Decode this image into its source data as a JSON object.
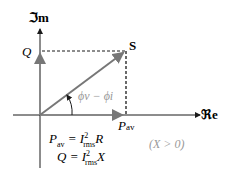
{
  "axes": {
    "imag_label": "ℑm",
    "real_label": "ℜe"
  },
  "labels": {
    "q": "Q",
    "s": "S",
    "pav": "P",
    "pav_sub": "av",
    "angle": "ϕv − ϕi"
  },
  "equations": {
    "line1": "Pav = I²rms R",
    "line2": "Q = I²rms X"
  },
  "condition": "(X > 0)",
  "colors": {
    "axis": "#1a1a1a",
    "vector": "#777777",
    "angle": "#9a9a9a"
  }
}
